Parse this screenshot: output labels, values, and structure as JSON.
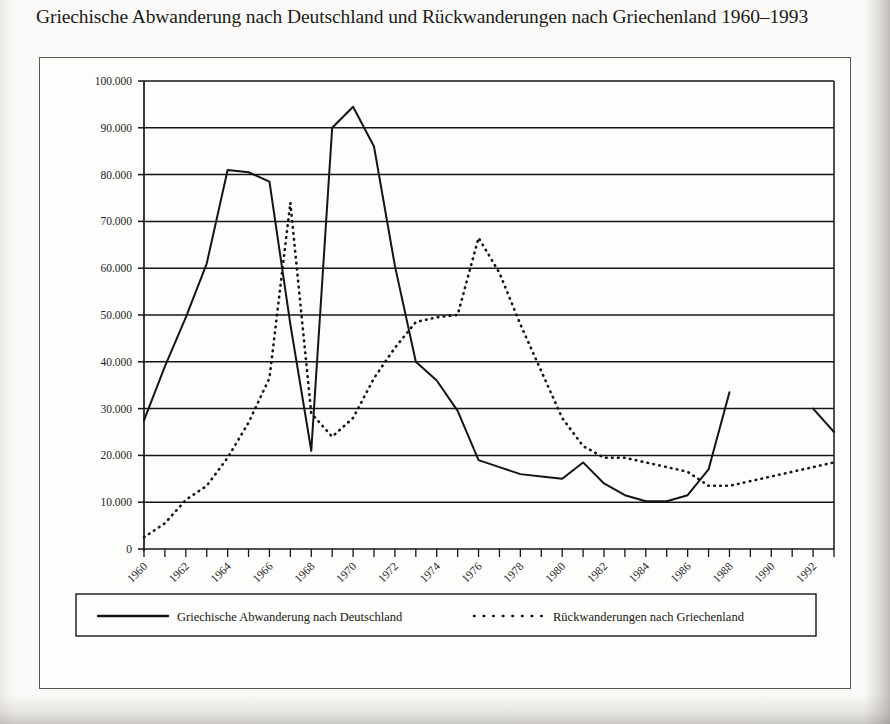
{
  "caption": {
    "text": "Griechische Abwanderung nach Deutschland und Rückwanderungen nach Griechenland 1960–1993"
  },
  "colors": {
    "ink": "#141414",
    "frame": "#5a5752",
    "grid": "#161616",
    "page": "#fbfaf8"
  },
  "chart_data": {
    "type": "line",
    "title": "Griechische Abwanderung nach Deutschland und Rückwanderungen nach Griechenland 1960–1993",
    "xlabel": "",
    "ylabel": "",
    "xlim": [
      1960,
      1993
    ],
    "ylim": [
      0,
      100000
    ],
    "grid": true,
    "legend_position": "bottom",
    "x": [
      1960,
      1961,
      1962,
      1963,
      1964,
      1965,
      1966,
      1967,
      1968,
      1969,
      1970,
      1971,
      1972,
      1973,
      1974,
      1975,
      1976,
      1977,
      1978,
      1979,
      1980,
      1981,
      1982,
      1983,
      1984,
      1985,
      1986,
      1987,
      1988,
      1989,
      1990,
      1991,
      1992,
      1993
    ],
    "x_tick_labels": [
      "1960",
      "1962",
      "1964",
      "1966",
      "1968",
      "1970",
      "1972",
      "1974",
      "1976",
      "1978",
      "1980",
      "1982",
      "1984",
      "1986",
      "1988",
      "1990",
      "1992"
    ],
    "y_tick_labels": [
      "0",
      "10.000",
      "20.000",
      "30.000",
      "40.000",
      "50.000",
      "60.000",
      "70.000",
      "80.000",
      "90.000",
      "100.000"
    ],
    "y_ticks": [
      0,
      10000,
      20000,
      30000,
      40000,
      50000,
      60000,
      70000,
      80000,
      90000,
      100000
    ],
    "series": [
      {
        "name": "Griechische Abwanderung nach Deutschland",
        "style": "solid",
        "values": [
          27500,
          39000,
          49500,
          61000,
          81000,
          80500,
          78500,
          48000,
          21000,
          90000,
          94500,
          86000,
          60500,
          40000,
          36000,
          29500,
          19000,
          17500,
          16000,
          15500,
          15000,
          18500,
          14000,
          11500,
          10200,
          10200,
          11500,
          17000,
          33500,
          null,
          null,
          null,
          30000,
          25000
        ]
      },
      {
        "name": "Rückwanderungen nach Griechenland",
        "style": "dotted",
        "values": [
          2500,
          5500,
          10500,
          13500,
          19500,
          27000,
          36500,
          74000,
          29000,
          24000,
          28000,
          36500,
          43000,
          48500,
          49500,
          50000,
          66500,
          59000,
          48000,
          38000,
          28000,
          22000,
          19500,
          19500,
          18500,
          17500,
          16500,
          13500,
          13500,
          14500,
          15500,
          16500,
          17500,
          18500
        ]
      }
    ]
  },
  "legend": {
    "entries": [
      {
        "label": "Griechische Abwanderung nach Deutschland",
        "style": "solid"
      },
      {
        "label": "Rückwanderungen nach Griechenland",
        "style": "dotted"
      }
    ]
  }
}
